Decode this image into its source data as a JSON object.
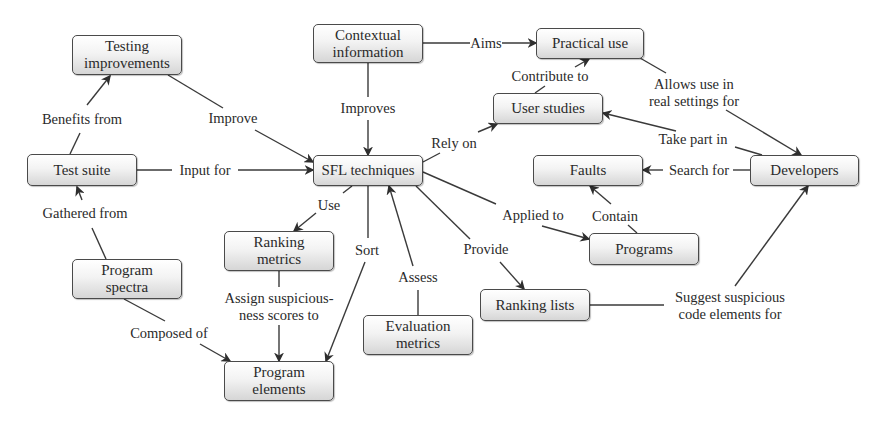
{
  "diagram": {
    "type": "concept-map",
    "colors": {
      "node_border": "#4a4a4a",
      "node_fill_top": "#ffffff",
      "node_fill_bottom": "#d6d6d6",
      "edge": "#3a3a3a",
      "text": "#2a2a2a",
      "background": "#ffffff"
    },
    "nodes": [
      {
        "id": "testing_improvements",
        "label": "Testing\nimprovements",
        "x": 72,
        "y": 35,
        "w": 110,
        "h": 40
      },
      {
        "id": "contextual_information",
        "label": "Contextual\ninformation",
        "x": 313,
        "y": 24,
        "w": 110,
        "h": 39
      },
      {
        "id": "practical_use",
        "label": "Practical use",
        "x": 536,
        "y": 28,
        "w": 108,
        "h": 31
      },
      {
        "id": "user_studies",
        "label": "User studies",
        "x": 493,
        "y": 93,
        "w": 110,
        "h": 31
      },
      {
        "id": "test_suite",
        "label": "Test suite",
        "x": 27,
        "y": 154,
        "w": 110,
        "h": 32
      },
      {
        "id": "sfl_techniques",
        "label": "SFL techniques",
        "x": 313,
        "y": 155,
        "w": 110,
        "h": 31
      },
      {
        "id": "faults",
        "label": "Faults",
        "x": 533,
        "y": 155,
        "w": 110,
        "h": 31
      },
      {
        "id": "developers",
        "label": "Developers",
        "x": 750,
        "y": 155,
        "w": 109,
        "h": 31
      },
      {
        "id": "ranking_metrics",
        "label": "Ranking\nmetrics",
        "x": 224,
        "y": 231,
        "w": 110,
        "h": 40
      },
      {
        "id": "programs",
        "label": "Programs",
        "x": 589,
        "y": 233,
        "w": 110,
        "h": 32
      },
      {
        "id": "program_spectra",
        "label": "Program\nspectra",
        "x": 72,
        "y": 259,
        "w": 110,
        "h": 40
      },
      {
        "id": "ranking_lists",
        "label": "Ranking lists",
        "x": 480,
        "y": 289,
        "w": 110,
        "h": 32
      },
      {
        "id": "evaluation_metrics",
        "label": "Evaluation\nmetrics",
        "x": 363,
        "y": 315,
        "w": 110,
        "h": 40
      },
      {
        "id": "program_elements",
        "label": "Program\nelements",
        "x": 224,
        "y": 361,
        "w": 110,
        "h": 40
      }
    ],
    "edges": [
      {
        "from": "test_suite",
        "to": "testing_improvements",
        "label": "Benefits from",
        "lx": 82,
        "ly": 119,
        "seg1": [
          [
            70,
            154
          ],
          [
            80,
            133
          ]
        ],
        "seg2": [
          [
            87,
            105
          ],
          [
            110,
            76
          ]
        ]
      },
      {
        "from": "testing_improvements",
        "to": "sfl_techniques",
        "label": "Improve",
        "lx": 233,
        "ly": 118,
        "seg1": [
          [
            168,
            75
          ],
          [
            223,
            108
          ]
        ],
        "seg2": [
          [
            255,
            130
          ],
          [
            313,
            162
          ]
        ]
      },
      {
        "from": "test_suite",
        "to": "sfl_techniques",
        "label": "Input for",
        "lx": 205,
        "ly": 170,
        "seg1": [
          [
            137,
            170
          ],
          [
            172,
            170
          ]
        ],
        "seg2": [
          [
            238,
            170
          ],
          [
            313,
            170
          ]
        ]
      },
      {
        "from": "program_spectra",
        "to": "test_suite",
        "label": "Gathered from",
        "lx": 85,
        "ly": 213,
        "seg1": [
          [
            106,
            259
          ],
          [
            92,
            228
          ]
        ],
        "seg2": [
          [
            82,
            200
          ],
          [
            77,
            187
          ]
        ]
      },
      {
        "from": "contextual_information",
        "to": "sfl_techniques",
        "label": "Improves",
        "lx": 368,
        "ly": 108,
        "seg1": [
          [
            368,
            63
          ],
          [
            368,
            97
          ]
        ],
        "seg2": [
          [
            368,
            120
          ],
          [
            368,
            155
          ]
        ]
      },
      {
        "from": "contextual_information",
        "to": "practical_use",
        "label": "Aims",
        "lx": 486,
        "ly": 43,
        "seg1": [
          [
            423,
            43
          ],
          [
            470,
            43
          ]
        ],
        "seg2": [
          [
            502,
            43
          ],
          [
            536,
            43
          ]
        ]
      },
      {
        "from": "user_studies",
        "to": "practical_use",
        "label": "Contribute to",
        "lx": 550,
        "ly": 76,
        "seg1": [
          [
            535,
            93
          ],
          [
            545,
            86
          ]
        ],
        "seg2": [
          [
            575,
            67
          ],
          [
            589,
            59
          ]
        ]
      },
      {
        "from": "practical_use",
        "to": "developers",
        "label": "Allows use in\nreal settings for",
        "lx": 694,
        "ly": 93,
        "seg1": [
          [
            640,
            58
          ],
          [
            666,
            73
          ]
        ],
        "seg2": [
          [
            726,
            110
          ],
          [
            801,
            155
          ]
        ]
      },
      {
        "from": "developers",
        "to": "user_studies",
        "label": "Take part in",
        "lx": 693,
        "ly": 139,
        "seg1": [
          [
            762,
            155
          ],
          [
            735,
            147
          ]
        ],
        "seg2": [
          [
            676,
            131
          ],
          [
            603,
            113
          ]
        ]
      },
      {
        "from": "sfl_techniques",
        "to": "user_studies",
        "label": "Rely on",
        "lx": 454,
        "ly": 143,
        "seg1": [
          [
            423,
            162
          ],
          [
            440,
            153
          ]
        ],
        "seg2": [
          [
            478,
            132
          ],
          [
            497,
            124
          ]
        ]
      },
      {
        "from": "developers",
        "to": "faults",
        "label": "Search for",
        "lx": 699,
        "ly": 170,
        "seg1": [
          [
            750,
            170
          ],
          [
            733,
            170
          ]
        ],
        "seg2": [
          [
            663,
            170
          ],
          [
            643,
            170
          ]
        ]
      },
      {
        "from": "programs",
        "to": "faults",
        "label": "Contain",
        "lx": 615,
        "ly": 216,
        "seg1": [
          [
            637,
            233
          ],
          [
            628,
            225
          ]
        ],
        "seg2": [
          [
            611,
            204
          ],
          [
            590,
            186
          ]
        ]
      },
      {
        "from": "sfl_techniques",
        "to": "programs",
        "label": "Applied to",
        "lx": 533,
        "ly": 215,
        "seg1": [
          [
            423,
            172
          ],
          [
            496,
            204
          ]
        ],
        "seg2": [
          [
            542,
            226
          ],
          [
            589,
            239
          ]
        ]
      },
      {
        "from": "sfl_techniques",
        "to": "ranking_metrics",
        "label": "Use",
        "lx": 329,
        "ly": 205,
        "seg1": [
          [
            352,
            186
          ],
          [
            343,
            193
          ]
        ],
        "seg2": [
          [
            316,
            213
          ],
          [
            294,
            231
          ]
        ]
      },
      {
        "from": "sfl_techniques",
        "to": "program_elements",
        "label": "Sort",
        "lx": 367,
        "ly": 250,
        "seg1": [
          [
            368,
            186
          ],
          [
            368,
            238
          ]
        ],
        "seg2": [
          [
            365,
            262
          ],
          [
            326,
            361
          ]
        ]
      },
      {
        "from": "evaluation_metrics",
        "to": "sfl_techniques",
        "label": "Assess",
        "lx": 418,
        "ly": 277,
        "seg1": [
          [
            418,
            315
          ],
          [
            418,
            290
          ]
        ],
        "seg2": [
          [
            413,
            266
          ],
          [
            389,
            186
          ]
        ]
      },
      {
        "from": "sfl_techniques",
        "to": "ranking_lists",
        "label": "Provide",
        "lx": 486,
        "ly": 249,
        "seg1": [
          [
            416,
            186
          ],
          [
            470,
            239
          ]
        ],
        "seg2": [
          [
            500,
            262
          ],
          [
            524,
            289
          ]
        ]
      },
      {
        "from": "ranking_metrics",
        "to": "program_elements",
        "label": "Assign suspicious-\nness scores to",
        "lx": 279,
        "ly": 307,
        "seg1": [
          [
            279,
            271
          ],
          [
            279,
            287
          ]
        ],
        "seg2": [
          [
            279,
            325
          ],
          [
            279,
            361
          ]
        ]
      },
      {
        "from": "program_spectra",
        "to": "program_elements",
        "label": "Composed of",
        "lx": 169,
        "ly": 333,
        "seg1": [
          [
            124,
            299
          ],
          [
            165,
            321
          ]
        ],
        "seg2": [
          [
            200,
            344
          ],
          [
            230,
            361
          ]
        ]
      },
      {
        "from": "ranking_lists",
        "to": "developers",
        "label": "Suggest suspicious\ncode elements for",
        "lx": 730,
        "ly": 306,
        "seg1": [
          [
            590,
            305
          ],
          [
            664,
            305
          ]
        ],
        "seg2": [
          [
            735,
            286
          ],
          [
            808,
            186
          ]
        ]
      }
    ]
  }
}
